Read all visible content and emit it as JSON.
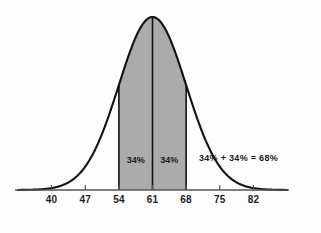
{
  "chart_data": {
    "type": "area",
    "title": "",
    "subtitle": "",
    "xlabel": "",
    "ylabel": "",
    "grid": false,
    "legend_position": "none",
    "distribution": "normal",
    "mean": 61,
    "std_dev": 7,
    "xlim": [
      33,
      89
    ],
    "ylim": [
      0,
      1
    ],
    "x_ticks": [
      40,
      47,
      54,
      61,
      68,
      75,
      82
    ],
    "x_tick_labels": [
      "40",
      "47",
      "54",
      "61",
      "68",
      "75",
      "82"
    ],
    "shaded_region": {
      "from": 54,
      "to": 68,
      "fill_color": "#ababab",
      "stroke_color": "#111111"
    },
    "center_line": {
      "at": 61,
      "color": "#111111"
    },
    "region_labels": [
      {
        "text": "34%",
        "x": 57.5,
        "y_frac": 0.175
      },
      {
        "text": "34%",
        "x": 64.5,
        "y_frac": 0.175
      }
    ],
    "annotations": [
      {
        "text": "34% + 34% = 68%",
        "x": 78.9,
        "y_frac": 0.185
      }
    ],
    "colors": {
      "background": "#fdfdfd",
      "curve": "#111111",
      "axis": "#555555",
      "fill": "#ababab",
      "text": "#1a1a1a"
    }
  }
}
